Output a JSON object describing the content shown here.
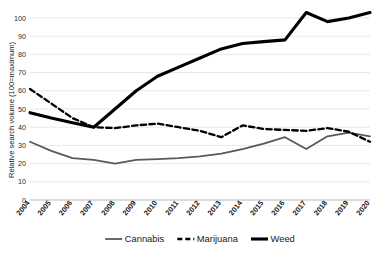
{
  "chart_data": {
    "type": "line",
    "title": "",
    "subtitle": "",
    "xlabel": "",
    "ylabel": "Relative search volume (100=maximum)",
    "categories": [
      "2004",
      "2005",
      "2006",
      "2007",
      "2008",
      "2009",
      "2010",
      "2011",
      "2012",
      "2013",
      "2014",
      "2015",
      "2016",
      "2017",
      "2018",
      "2019",
      "2020"
    ],
    "x": [
      2004,
      2005,
      2006,
      2007,
      2008,
      2009,
      2010,
      2011,
      2012,
      2013,
      2014,
      2015,
      2016,
      2017,
      2018,
      2019,
      2020
    ],
    "ylim": [
      0,
      100
    ],
    "xlim": [
      2004,
      2020
    ],
    "yticks": [
      0,
      10,
      20,
      30,
      40,
      50,
      60,
      70,
      80,
      90,
      100
    ],
    "grid": true,
    "legend_position": "bottom",
    "series": [
      {
        "name": "Cannabis",
        "color": "#595959",
        "style": "solid",
        "width": 1.8,
        "values": [
          32,
          27,
          23,
          22,
          20,
          22,
          22.5,
          23,
          24,
          25.5,
          28,
          31,
          34.5,
          28,
          35,
          37,
          35
        ]
      },
      {
        "name": "Marijuana",
        "color": "#000000",
        "style": "dashed",
        "width": 2.3,
        "values": [
          61,
          53,
          45,
          40,
          39.5,
          41,
          42,
          40,
          38,
          34.5,
          41,
          39,
          38.5,
          38,
          39.5,
          37.5,
          32
        ]
      },
      {
        "name": "Weed",
        "color": "#000000",
        "style": "solid",
        "width": 3.1,
        "values": [
          48,
          45,
          42.5,
          40,
          50,
          60,
          68,
          73,
          78,
          83,
          86,
          87,
          88,
          103,
          98,
          100,
          103
        ]
      }
    ]
  },
  "legend": {
    "items": [
      {
        "label": "Cannabis",
        "color": "#595959",
        "style": "solid"
      },
      {
        "label": "Marijuana",
        "color": "#000000",
        "style": "dashed"
      },
      {
        "label": "Weed",
        "color": "#000000",
        "style": "solid"
      }
    ]
  },
  "axes": {
    "y_title": "Relative search volume (100=maximum)",
    "y_tick_labels": [
      "0",
      "10",
      "20",
      "30",
      "40",
      "50",
      "60",
      "70",
      "80",
      "90",
      "100"
    ],
    "x_tick_labels": [
      "2004",
      "2005",
      "2006",
      "2007",
      "2008",
      "2009",
      "2010",
      "2011",
      "2012",
      "2013",
      "2014",
      "2015",
      "2016",
      "2017",
      "2018",
      "2019",
      "2020"
    ]
  }
}
